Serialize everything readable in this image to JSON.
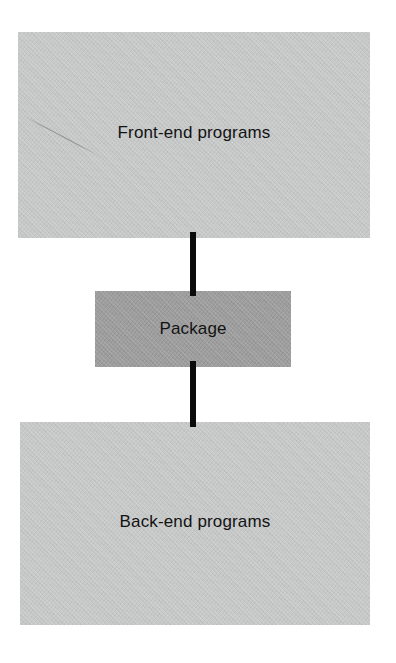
{
  "diagram": {
    "type": "flowchart",
    "orientation": "vertical",
    "background_color": "#ffffff",
    "nodes": [
      {
        "id": "frontend",
        "label": "Front-end programs",
        "shape": "rectangle",
        "fill_color": "#c7c8c8",
        "text_color": "#131313"
      },
      {
        "id": "package",
        "label": "Package",
        "shape": "rectangle",
        "fill_color": "#9b9b9b",
        "text_color": "#131313"
      },
      {
        "id": "backend",
        "label": "Back-end programs",
        "shape": "rectangle",
        "fill_color": "#c7c8c8",
        "text_color": "#131313"
      }
    ],
    "connectors": [
      {
        "id": "frontend-package",
        "from": "frontend",
        "to": "package",
        "style": "solid-line",
        "color": "#0b0b0b"
      },
      {
        "id": "package-backend",
        "from": "package",
        "to": "backend",
        "style": "solid-line",
        "color": "#0b0b0b"
      }
    ],
    "artifacts": [
      {
        "id": "scan-scratch",
        "kind": "scan-scratch-line"
      }
    ]
  }
}
